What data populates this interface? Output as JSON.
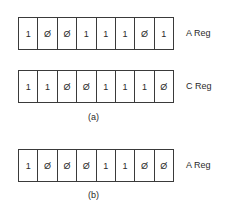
{
  "registers": [
    {
      "name": "A Reg",
      "bits": [
        "1",
        "Ø",
        "Ø",
        "1",
        "1",
        "1",
        "Ø",
        "1"
      ]
    },
    {
      "name": "C Reg",
      "bits": [
        "1",
        "1",
        "Ø",
        "Ø",
        "1",
        "1",
        "1",
        "Ø"
      ]
    },
    {
      "name": "A Reg",
      "bits": [
        "1",
        "Ø",
        "Ø",
        "Ø",
        "1",
        "1",
        "Ø",
        "Ø"
      ]
    }
  ],
  "captions": {
    "a": "(a)",
    "b": "(b)"
  }
}
